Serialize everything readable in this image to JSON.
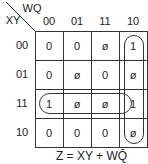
{
  "kmap": {
    "row_var": "XY",
    "col_var": "WQ",
    "col_headers": [
      "00",
      "01",
      "11",
      "10"
    ],
    "row_headers": [
      "00",
      "01",
      "11",
      "10"
    ],
    "cells": [
      [
        "0",
        "0",
        "ø",
        "1"
      ],
      [
        "0",
        "ø",
        "0",
        "ø"
      ],
      [
        "1",
        "ø",
        "ø",
        "1"
      ],
      [
        "0",
        "0",
        "0",
        "ø"
      ]
    ],
    "groups": [
      {
        "name": "XY",
        "cells": "row 11, all columns"
      },
      {
        "name": "WQ-bar",
        "cells": "column 10, all rows"
      }
    ]
  },
  "equation": "Z = XY + WQ̄"
}
